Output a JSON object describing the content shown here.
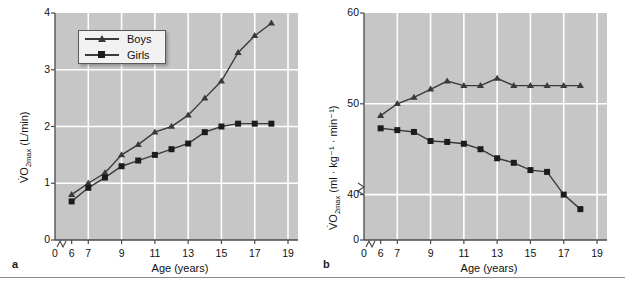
{
  "figure": {
    "background": "#ffffff",
    "plot_background": "#c6c6c6",
    "grid_color": "#ffffff",
    "series_color": "#3a3a3a",
    "rule_y": 277
  },
  "panels": [
    {
      "id": "a",
      "label": "a",
      "legend": {
        "visible": true,
        "entries": [
          {
            "label": "Boys",
            "marker": "triangle"
          },
          {
            "label": "Girls",
            "marker": "square"
          }
        ]
      }
    },
    {
      "id": "b",
      "label": "b",
      "legend": {
        "visible": false,
        "entries": []
      }
    }
  ],
  "chart_data": [
    {
      "type": "line",
      "panel": "a",
      "title": "",
      "xlabel": "Age (years)",
      "ylabel": "V̇O2max (L/min)",
      "ylabel_parts": {
        "base": "V̇O",
        "sub": "2max",
        "unit": " (L/min)"
      },
      "x": [
        6,
        7,
        8,
        9,
        10,
        11,
        12,
        13,
        14,
        15,
        16,
        17,
        18
      ],
      "xlim": [
        5,
        19.6
      ],
      "ylim": [
        0,
        4
      ],
      "xticks": [
        0,
        6,
        7,
        9,
        11,
        13,
        15,
        17,
        19
      ],
      "yticks": [
        0,
        1,
        2,
        3,
        4
      ],
      "grid": true,
      "axis_break_x": true,
      "axis_break_y": false,
      "series": [
        {
          "name": "Boys",
          "marker": "triangle",
          "values": [
            0.8,
            1.0,
            1.18,
            1.5,
            1.68,
            1.9,
            2.0,
            2.2,
            2.5,
            2.8,
            3.3,
            3.6,
            3.82
          ]
        },
        {
          "name": "Girls",
          "marker": "square",
          "values": [
            0.68,
            0.92,
            1.1,
            1.3,
            1.4,
            1.5,
            1.6,
            1.7,
            1.9,
            2.0,
            2.05,
            2.05,
            2.05
          ]
        }
      ]
    },
    {
      "type": "line",
      "panel": "b",
      "title": "",
      "xlabel": "Age (years)",
      "ylabel": "V̇O2max (ml · kg⁻¹ · min⁻¹)",
      "ylabel_parts": {
        "base": "V̇O",
        "sub": "2max",
        "unit": " (ml · kg⁻¹ · min⁻¹)"
      },
      "x": [
        6,
        7,
        8,
        9,
        10,
        11,
        12,
        13,
        14,
        15,
        16,
        17,
        18
      ],
      "xlim": [
        5,
        19.6
      ],
      "ylim": [
        35,
        60
      ],
      "yticks": [
        0,
        40,
        50,
        60
      ],
      "xticks": [
        0,
        6,
        7,
        9,
        11,
        13,
        15,
        17,
        19
      ],
      "grid": true,
      "axis_break_x": true,
      "axis_break_y": true,
      "series": [
        {
          "name": "Boys",
          "marker": "triangle",
          "values": [
            48.7,
            50.0,
            50.7,
            51.6,
            52.5,
            52.0,
            52.0,
            52.8,
            52.0,
            52.0,
            52.0,
            52.0,
            52.0
          ]
        },
        {
          "name": "Girls",
          "marker": "square",
          "values": [
            47.3,
            47.1,
            46.9,
            45.9,
            45.8,
            45.6,
            45.0,
            44.0,
            43.5,
            42.7,
            42.5,
            40.0,
            38.4
          ]
        }
      ]
    }
  ]
}
